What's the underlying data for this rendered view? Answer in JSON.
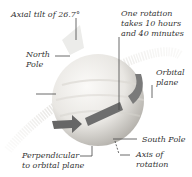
{
  "diagram": {
    "labels": {
      "axial_tilt": "Axial tilt of 26.7°",
      "rotation_line1": "One rotation",
      "rotation_line2": "takes 10 hours",
      "rotation_line3": "and 40 minutes",
      "north_pole_line1": "North",
      "north_pole_line2": "Pole",
      "orbital_plane_line1": "Orbital",
      "orbital_plane_line2": "plane",
      "south_pole": "South Pole",
      "axis_line1": "Axis of",
      "axis_line2": "rotation",
      "perpendicular_line1": "Perpendicular",
      "perpendicular_line2": "to orbital plane"
    },
    "colors": {
      "planet_light": "#f4f2ee",
      "planet_shadow": "#b9b6b0",
      "arrow": "#6e6e6e",
      "ring": "#d8d6d2",
      "leader": "#444444"
    }
  }
}
